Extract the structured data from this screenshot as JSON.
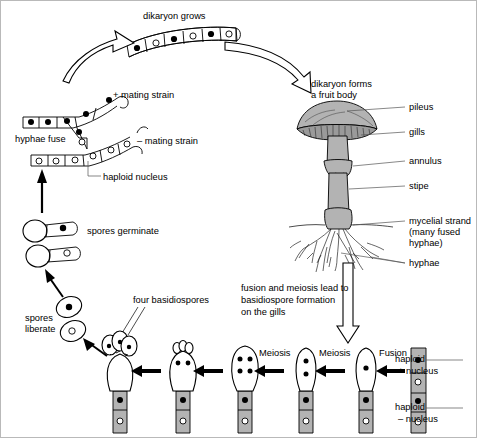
{
  "diagram": {
    "background_color": "#ffffff",
    "ink_color": "#000000",
    "fill_grey": "#b3b3b3"
  },
  "labels": {
    "dikaryon_grows": "dikaryon grows",
    "dikaryon_forms": "dikaryon forms",
    "a_fruit_body": "a fruit body",
    "plus_mating_strain": "+ mating strain",
    "minus_mating_strain": "– mating strain",
    "hyphae_fuse": "hyphae fuse",
    "haploid_nucleus": "haploid nucleus",
    "spores_germinate": "spores germinate",
    "spores": "spores",
    "liberate": "liberate",
    "four_basidiospores": "four basidiospores",
    "meiosis_1": "Meiosis",
    "meiosis_2": "Meiosis",
    "fusion": "Fusion",
    "fusion_text_1": "fusion and meiosis lead to",
    "fusion_text_2": "basidiospore formation",
    "fusion_text_3": "on the gills",
    "pileus": "pileus",
    "gills": "gills",
    "annulus": "annulus",
    "stipe": "stipe",
    "mycelial_1": "mycelial strand",
    "mycelial_2": "(many fused",
    "mycelial_3": "hyphae)",
    "hyphae": "hyphae",
    "haploid_plus_1": "haploid",
    "haploid_plus_2": "+ nucleus",
    "haploid_minus_1": "haploid",
    "haploid_minus_2": "– nucleus"
  },
  "stages": {
    "dikaryon_cells": 6,
    "basidium_sequence": [
      {
        "name": "haploid-pair",
        "nuclei": 2,
        "note": "haploid + and – nuclei"
      },
      {
        "name": "fused",
        "nuclei": 1,
        "note": "after Fusion"
      },
      {
        "name": "meiosis-two",
        "nuclei": 2,
        "note": "after first Meiosis"
      },
      {
        "name": "meiosis-four",
        "nuclei": 4,
        "note": "after second Meiosis"
      },
      {
        "name": "budding",
        "nuclei": 4,
        "note": "sterigmata forming"
      },
      {
        "name": "four-basidiospores",
        "nuclei": 4,
        "note": "four basidiospores"
      }
    ],
    "free_spores": 2,
    "germinating_spores": 2
  }
}
